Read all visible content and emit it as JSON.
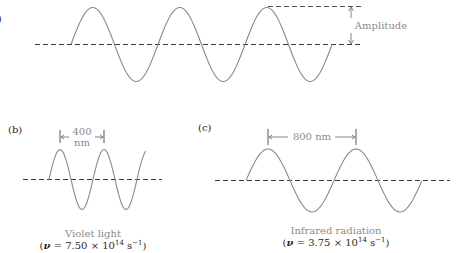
{
  "figure": {
    "panel_a": {
      "label": "(a)",
      "amplitude_label": "Amplitude",
      "cycles": 3
    },
    "panel_b": {
      "label": "(b)",
      "wavelength_value": "400",
      "wavelength_unit": "nm",
      "caption": "Violet light",
      "formula": {
        "prefix": "(",
        "symbol": "ν",
        "equals": " = 7.50 × 10",
        "exponent": "14",
        "unit": " s",
        "unit_exponent": "−1",
        "suffix": ")"
      },
      "cycles": 2.2
    },
    "panel_c": {
      "label": "(c)",
      "wavelength_label": "800 nm",
      "caption": "Infrared radiation",
      "formula": {
        "prefix": "(",
        "symbol": "ν",
        "equals": " = 3.75 × 10",
        "exponent": "14",
        "unit": " s",
        "unit_exponent": "−1",
        "suffix": ")"
      },
      "cycles": 2
    },
    "colors": {
      "wave": "#8a8a8a",
      "axis": "#3a3a3a",
      "label_gray": "#8c8c8c"
    }
  }
}
